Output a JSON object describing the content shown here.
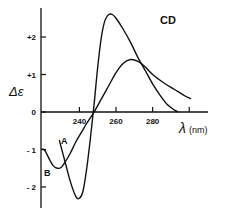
{
  "chart_data": {
    "type": "line",
    "title": "CD",
    "xlabel": "λ(nm)",
    "ylabel": "Δε",
    "xlim": [
      219,
      305
    ],
    "ylim": [
      -2.6,
      2.8
    ],
    "x_ticks": [
      240,
      260,
      280,
      300
    ],
    "x_tick_labels": [
      "240",
      "260",
      "280"
    ],
    "y_ticks": [
      -2,
      -1,
      0,
      1,
      2
    ],
    "y_tick_labels": [
      "- 2",
      "- 1",
      "0",
      "+1",
      "+2"
    ],
    "grid": false,
    "legend": "inline curve labels A and B",
    "series": [
      {
        "name": "A",
        "x": [
          229,
          232,
          235,
          238,
          240,
          242,
          244,
          246,
          248,
          250,
          252,
          254,
          256,
          258,
          260,
          264,
          268,
          272,
          276,
          280,
          284,
          288,
          292,
          294
        ],
        "y": [
          -0.75,
          -1.3,
          -1.85,
          -2.25,
          -2.3,
          -2.1,
          -1.5,
          -0.7,
          0.2,
          1.2,
          2.0,
          2.45,
          2.6,
          2.6,
          2.5,
          2.2,
          1.85,
          1.45,
          1.1,
          0.75,
          0.45,
          0.2,
          0.05,
          0.0
        ]
      },
      {
        "name": "B",
        "x": [
          219,
          221,
          224,
          226,
          228,
          230,
          232,
          235,
          238,
          241,
          244,
          248,
          252,
          256,
          260,
          264,
          268,
          272,
          276,
          280,
          286,
          292,
          298,
          301
        ],
        "y": [
          -1.0,
          -1.02,
          -1.3,
          -1.45,
          -1.5,
          -1.48,
          -1.35,
          -1.1,
          -0.8,
          -0.55,
          -0.3,
          0.0,
          0.35,
          0.7,
          1.05,
          1.3,
          1.4,
          1.35,
          1.2,
          1.0,
          0.78,
          0.6,
          0.42,
          0.35
        ]
      }
    ],
    "annotations": [
      {
        "text": "A",
        "x": 233,
        "y": -0.6
      },
      {
        "text": "B",
        "x": 222,
        "y": -1.85
      }
    ]
  },
  "labels": {
    "title": "CD",
    "xlabel_symbol": "λ",
    "xlabel_unit": "(nm)",
    "ylabel": "Δε",
    "curve_a": "A",
    "curve_b": "B"
  }
}
